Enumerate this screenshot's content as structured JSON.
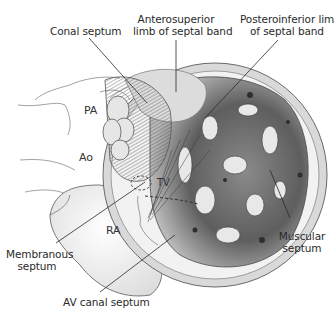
{
  "figure": {
    "colors": {
      "background": "#ffffff",
      "line": "#3a3a3a",
      "tissue_light": "#e6e6e6",
      "tissue_mid": "#a9a9a9",
      "tissue_dark": "#4a4a4a"
    },
    "labels": {
      "conal_septum": "Conal septum",
      "anterosuperior_line1": "Anterosuperior",
      "anterosuperior_line2": "limb of septal band",
      "posteroinferior_line1": "Posteroinferior limb",
      "posteroinferior_line2": "of septal band",
      "pa": "PA",
      "ao": "Ao",
      "tv": "TV",
      "ra": "RA",
      "membranous_line1": "Membranous",
      "membranous_line2": "septum",
      "muscular_line1": "Muscular",
      "muscular_line2": "septum",
      "av_canal": "AV canal septum"
    }
  }
}
